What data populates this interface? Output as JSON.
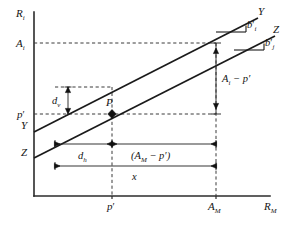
{
  "figure": {
    "kind": "geometric-diagram",
    "background_color": "#ffffff",
    "line_color": "#1a1a1a",
    "dashed_color": "#3a3a3a"
  },
  "axes": {
    "y_axis_label": "R",
    "y_axis_label_sub": "i",
    "x_axis_label": "R",
    "x_axis_label_sub": "M",
    "y_ticks": [
      {
        "label": "A",
        "sub": "i",
        "prime": ""
      },
      {
        "label": "p",
        "sub": "",
        "prime": "′"
      }
    ],
    "x_ticks": [
      {
        "label": "p",
        "sub": "",
        "prime": "′"
      },
      {
        "label": "A",
        "sub": "M",
        "prime": ""
      }
    ]
  },
  "lines": [
    {
      "name": "line-Y",
      "label_left": "Y",
      "label_right": "Y",
      "slope_label": "b",
      "slope_sub": "i",
      "slope_prime": "′"
    },
    {
      "name": "line-Z",
      "label_left": "Z",
      "label_right": "Z",
      "slope_label": "b",
      "slope_sub": "j",
      "slope_prime": "′"
    }
  ],
  "points": [
    {
      "name": "point-P",
      "label": "P"
    }
  ],
  "dimensions": [
    {
      "name": "dim-dv",
      "label": "d",
      "sub": "v",
      "orientation": "vertical"
    },
    {
      "name": "dim-ai-minus-pprime",
      "label": "A",
      "sub": "i",
      "suffix": " − p′",
      "orientation": "vertical"
    },
    {
      "name": "dim-dh",
      "label": "d",
      "sub": "h",
      "orientation": "horizontal"
    },
    {
      "name": "dim-am-minus-pprime",
      "label_full": "(A",
      "sub": "M",
      "suffix": " − p′)",
      "orientation": "horizontal"
    },
    {
      "name": "dim-x",
      "label": "x",
      "sub": "",
      "orientation": "horizontal"
    }
  ]
}
